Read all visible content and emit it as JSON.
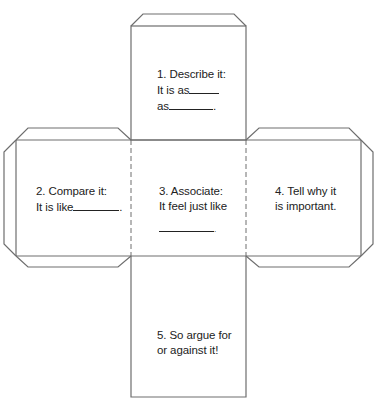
{
  "diagram": {
    "type": "cube-net",
    "stroke_color": "#6e6e6e",
    "faces": [
      {
        "id": "top",
        "number": "1",
        "lines": [
          "1. Describe it:",
          "It is as",
          "as"
        ],
        "end_mark": "."
      },
      {
        "id": "left",
        "number": "2",
        "lines": [
          "2. Compare it:",
          "It is like"
        ],
        "end_mark": "."
      },
      {
        "id": "center",
        "number": "3",
        "lines": [
          "3. Associate:",
          "It feel just like"
        ],
        "end_mark": "."
      },
      {
        "id": "right",
        "number": "4",
        "lines": [
          "4. Tell why it",
          "is important."
        ]
      },
      {
        "id": "bottom",
        "number": "5",
        "lines": [
          "5. So argue for",
          "or against it!"
        ]
      }
    ]
  }
}
